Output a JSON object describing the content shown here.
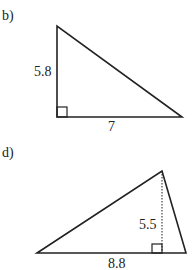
{
  "figures": [
    {
      "label": "b)",
      "type": "right-triangle",
      "sides": {
        "height": "5.8",
        "base": "7"
      }
    },
    {
      "label": "d)",
      "type": "triangle-with-altitude",
      "sides": {
        "height": "5.5",
        "base": "8.8"
      }
    }
  ],
  "colors": {
    "line": "#222222",
    "background": "#ffffff"
  }
}
